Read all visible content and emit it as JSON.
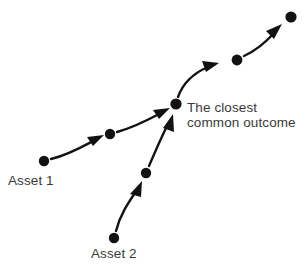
{
  "diagram": {
    "background_color": "#ffffff",
    "dot_color": "#121212",
    "arrow_color": "#121212",
    "text_color": "#3a3a3a",
    "labels": {
      "asset_1": "Asset 1",
      "asset_2": "Asset 2",
      "common_outcome_line_1": "The closest",
      "common_outcome_line_2": "common outcome"
    },
    "nodes": [
      {
        "id": "a1-start",
        "name": "asset-1-start-node",
        "x": 44,
        "y": 161,
        "r": 5.2
      },
      {
        "id": "a1-mid",
        "name": "asset-1-mid-node",
        "x": 110,
        "y": 134,
        "r": 5.2
      },
      {
        "id": "junction",
        "name": "common-outcome-node",
        "x": 176,
        "y": 104,
        "r": 5.6
      },
      {
        "id": "shared-mid",
        "name": "shared-path-mid-node",
        "x": 237,
        "y": 60,
        "r": 5.4
      },
      {
        "id": "shared-end",
        "name": "shared-path-end-node",
        "x": 291,
        "y": 17,
        "r": 5.6
      },
      {
        "id": "a2-start",
        "name": "asset-2-start-node",
        "x": 114,
        "y": 238,
        "r": 5.2
      },
      {
        "id": "a2-mid",
        "name": "asset-2-mid-node",
        "x": 146,
        "y": 173,
        "r": 5.2
      }
    ],
    "edges": [
      {
        "id": "e1",
        "name": "arrow-asset1-start-to-mid",
        "from": "a1-start",
        "to": "a1-mid"
      },
      {
        "id": "e2",
        "name": "arrow-asset1-mid-to-junction",
        "from": "a1-mid",
        "to": "junction"
      },
      {
        "id": "e3",
        "name": "arrow-asset2-start-to-mid",
        "from": "a2-start",
        "to": "a2-mid"
      },
      {
        "id": "e4",
        "name": "arrow-asset2-mid-to-junction",
        "from": "a2-mid",
        "to": "junction"
      },
      {
        "id": "e5",
        "name": "arrow-junction-to-shared-mid",
        "from": "junction",
        "to": "shared-mid"
      },
      {
        "id": "e6",
        "name": "arrow-shared-mid-to-end",
        "from": "shared-mid",
        "to": "shared-end"
      }
    ]
  }
}
